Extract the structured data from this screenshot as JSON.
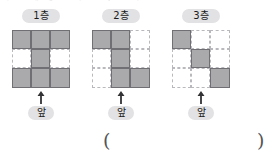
{
  "page": {
    "top_text_fragment": "ᅡ ᅳ ᅢ ᅦ ᅩ ᅧ ᅵ ᅥ ᅳ ᅡ",
    "background_color": "#ffffff"
  },
  "colors": {
    "filled_cell": "#aaaaac",
    "filled_cell_border": "#6f6f74",
    "empty_cell_border": "#b9b9bd",
    "label_chip_background": "#e2e2e4",
    "text": "#1b1b1b",
    "arrow": "#333336"
  },
  "figures": [
    {
      "floor_label": "1층",
      "front_label": "앞",
      "arrow_icon": "arrow-up-icon",
      "grid": {
        "rows": 3,
        "cols": 3,
        "filled": [
          [
            1,
            1,
            1
          ],
          [
            0,
            1,
            0
          ],
          [
            1,
            1,
            1
          ]
        ],
        "filled_count": 7
      }
    },
    {
      "floor_label": "2층",
      "front_label": "앞",
      "arrow_icon": "arrow-up-icon",
      "grid": {
        "rows": 3,
        "cols": 3,
        "filled": [
          [
            1,
            1,
            0
          ],
          [
            0,
            1,
            0
          ],
          [
            0,
            1,
            1
          ]
        ],
        "filled_count": 5
      }
    },
    {
      "floor_label": "3층",
      "front_label": "앞",
      "arrow_icon": "arrow-up-icon",
      "grid": {
        "rows": 3,
        "cols": 3,
        "filled": [
          [
            1,
            0,
            0
          ],
          [
            0,
            1,
            0
          ],
          [
            0,
            0,
            1
          ]
        ],
        "filled_count": 3
      }
    }
  ],
  "answer": {
    "open_paren": "(",
    "close_paren": ")",
    "value": ""
  }
}
